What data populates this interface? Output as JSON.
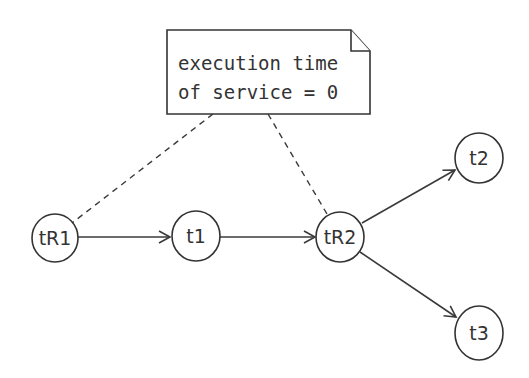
{
  "diagram": {
    "note": {
      "lines": [
        "execution time",
        "of service = 0"
      ]
    },
    "nodes": [
      {
        "id": "tR1",
        "label": "tR1"
      },
      {
        "id": "t1",
        "label": "t1"
      },
      {
        "id": "tR2",
        "label": "tR2"
      },
      {
        "id": "t2",
        "label": "t2"
      },
      {
        "id": "t3",
        "label": "t3"
      }
    ],
    "edges": [
      {
        "from": "tR1",
        "to": "t1",
        "style": "solid-arrow"
      },
      {
        "from": "t1",
        "to": "tR2",
        "style": "solid-arrow"
      },
      {
        "from": "tR2",
        "to": "t2",
        "style": "solid-arrow"
      },
      {
        "from": "tR2",
        "to": "t3",
        "style": "solid-arrow"
      },
      {
        "from": "note",
        "to": "tR1",
        "style": "dashed"
      },
      {
        "from": "note",
        "to": "tR2",
        "style": "dashed"
      }
    ],
    "colors": {
      "stroke": "#333333",
      "background": "#ffffff"
    }
  }
}
